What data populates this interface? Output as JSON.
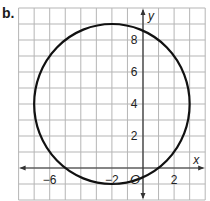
{
  "part_label": "b.",
  "chart_data": {
    "type": "line",
    "title": "",
    "xlabel": "x",
    "ylabel": "y",
    "xlim": [
      -8,
      4
    ],
    "ylim": [
      -2,
      10
    ],
    "grid": true,
    "grid_step": 1,
    "x_ticks": [
      {
        "value": -6,
        "label": "−6"
      },
      {
        "value": -2,
        "label": "−2"
      },
      {
        "value": 2,
        "label": "2"
      }
    ],
    "y_ticks": [
      {
        "value": 2,
        "label": "2"
      },
      {
        "value": 4,
        "label": "4"
      },
      {
        "value": 6,
        "label": "6"
      },
      {
        "value": 8,
        "label": "8"
      }
    ],
    "origin_label": "O",
    "series": [
      {
        "name": "circle",
        "shape": "circle",
        "center": [
          -2,
          4
        ],
        "radius": 5,
        "color": "#111111"
      }
    ]
  },
  "colors": {
    "grid": "#b5b5b5",
    "axis": "#333333",
    "curve": "#111111"
  }
}
